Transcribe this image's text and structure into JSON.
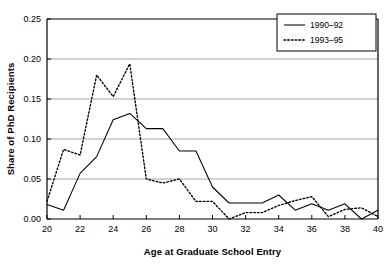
{
  "chart_data": {
    "type": "line",
    "title": "",
    "xlabel": "Age at Graduate School Entry",
    "ylabel": "Share of PhD Recipients",
    "xlim": [
      20,
      40
    ],
    "ylim": [
      0.0,
      0.25
    ],
    "grid": true,
    "legend_position": "top-right",
    "x": [
      20,
      21,
      22,
      23,
      24,
      25,
      26,
      27,
      28,
      29,
      30,
      31,
      32,
      33,
      34,
      35,
      36,
      37,
      38,
      39,
      40
    ],
    "xticks": [
      20,
      22,
      24,
      26,
      28,
      30,
      32,
      34,
      36,
      38,
      40
    ],
    "xtick_labels": [
      "20",
      "22",
      "24",
      "26",
      "28",
      "30",
      "32",
      "34",
      "36",
      "38",
      "40"
    ],
    "yticks": [
      0.0,
      0.05,
      0.1,
      0.15,
      0.2,
      0.25
    ],
    "ytick_labels": [
      "0.00",
      "0.05",
      "0.10",
      "0.15",
      "0.20",
      "0.25"
    ],
    "series": [
      {
        "name": "1990–92",
        "style": "solid",
        "color": "#000000",
        "values": [
          0.018,
          0.011,
          0.057,
          0.078,
          0.124,
          0.132,
          0.113,
          0.113,
          0.085,
          0.085,
          0.04,
          0.02,
          0.02,
          0.02,
          0.03,
          0.011,
          0.019,
          0.011,
          0.019,
          0.0,
          0.011
        ]
      },
      {
        "name": "1993–95",
        "style": "dashed",
        "color": "#000000",
        "values": [
          0.022,
          0.087,
          0.08,
          0.18,
          0.153,
          0.194,
          0.05,
          0.045,
          0.05,
          0.022,
          0.022,
          0.0,
          0.008,
          0.008,
          0.017,
          0.023,
          0.028,
          0.003,
          0.012,
          0.014,
          0.003
        ]
      }
    ]
  },
  "legend": {
    "entries": [
      {
        "label": "1990–92"
      },
      {
        "label": "1993–95"
      }
    ]
  }
}
